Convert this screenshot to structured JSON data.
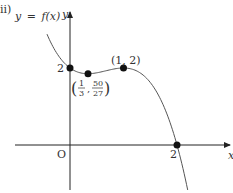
{
  "part_label": "ii)",
  "curve_label": {
    "lhs": "y",
    "eq": "=",
    "rhs": "f(x)"
  },
  "axes": {
    "x_label": "x",
    "y_label": "y",
    "origin_label": "O"
  },
  "points": [
    {
      "name": "y-intercept",
      "label": "2",
      "x": 0,
      "y": 2
    },
    {
      "name": "local-minimum",
      "label_x_num": "1",
      "label_x_den": "3",
      "label_y_num": "50",
      "label_y_den": "27",
      "x": 0.3333,
      "y": 1.8519
    },
    {
      "name": "local-maximum",
      "label": "(1, 2)",
      "x": 1,
      "y": 2
    },
    {
      "name": "x-intercept",
      "label": "2",
      "x": 2,
      "y": 0
    }
  ],
  "chart_data": {
    "type": "line",
    "title": "",
    "function": "y = f(x) = -x^3 + 2x^2 - x + 2",
    "xlabel": "x",
    "ylabel": "y",
    "x_range": [
      -0.43,
      2.2
    ],
    "key_points": [
      {
        "x": 0,
        "y": 2,
        "label": "2"
      },
      {
        "x": 0.3333,
        "y": 1.8519,
        "label": "(1/3, 50/27)"
      },
      {
        "x": 1,
        "y": 2,
        "label": "(1, 2)"
      },
      {
        "x": 2,
        "y": 0,
        "label": "2"
      }
    ],
    "grid": false,
    "colors": {
      "curve": "#555555",
      "axes": "#222222",
      "points": "#111111"
    }
  }
}
